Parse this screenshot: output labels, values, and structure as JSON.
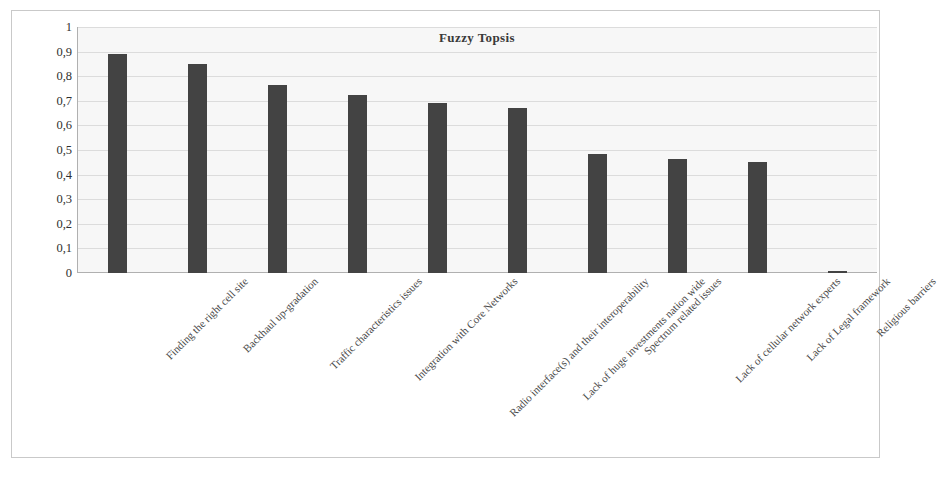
{
  "chart_data": {
    "type": "bar",
    "title": "Fuzzy Topsis",
    "xlabel": "",
    "ylabel": "",
    "ylim": [
      0,
      1
    ],
    "grid": true,
    "legend": "none",
    "y_ticks": [
      "0",
      "0,1",
      "0,2",
      "0,3",
      "0,4",
      "0,5",
      "0,6",
      "0,7",
      "0,8",
      "0,9",
      "1"
    ],
    "categories": [
      "Finding the right cell site",
      "Backhaul up-gradation",
      "Traffic characteristics issues",
      "Integration with Core Networks",
      "Radio interface(s) and their interoperability",
      "Lack of huge investments nation wide",
      "Spectrum related issues",
      "Lack of cellular network experts",
      "Lack of Legal framework",
      "Religious barriers"
    ],
    "values": [
      0.89,
      0.85,
      0.765,
      0.725,
      0.69,
      0.67,
      0.485,
      0.465,
      0.45,
      0.01
    ],
    "bar_color": "#434343",
    "plot_background": "#f7f7f7",
    "gridline_color": "#dcdcdc"
  }
}
